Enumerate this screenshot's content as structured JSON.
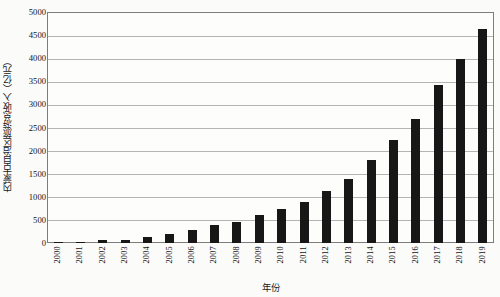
{
  "chart_data": {
    "type": "bar",
    "title": "",
    "xlabel": "年份",
    "ylabel": "内蒙古自治区旅游总收入（亿元）",
    "categories": [
      "2000",
      "2001",
      "2002",
      "2003",
      "2004",
      "2005",
      "2006",
      "2007",
      "2008",
      "2009",
      "2010",
      "2011",
      "2012",
      "2013",
      "2014",
      "2015",
      "2016",
      "2017",
      "2018",
      "2019"
    ],
    "values": [
      20,
      30,
      55,
      65,
      120,
      195,
      275,
      390,
      465,
      610,
      730,
      880,
      1120,
      1395,
      1790,
      2240,
      2690,
      3420,
      3985,
      4630
    ],
    "series": [
      {
        "name": "内蒙古自治区旅游总收入（亿元）",
        "values": [
          20,
          30,
          55,
          65,
          120,
          195,
          275,
          390,
          465,
          610,
          730,
          880,
          1120,
          1395,
          1790,
          2240,
          2690,
          3420,
          3985,
          4630
        ]
      }
    ],
    "ylim": [
      0,
      5000
    ],
    "ytick_values": [
      0,
      500,
      1000,
      1500,
      2000,
      2500,
      3000,
      3500,
      4000,
      4500,
      5000
    ],
    "ytick_labels": [
      "0",
      "500",
      "1000",
      "1500",
      "2000",
      "2500",
      "3000",
      "3500",
      "4000",
      "4500",
      "5000"
    ],
    "grid": "horizontal",
    "legend": "none",
    "bar_color": "#171717",
    "grid_color": "#b4b4b4",
    "frame_color": "#7d7d7d",
    "background_color": "#fdfdfc"
  }
}
